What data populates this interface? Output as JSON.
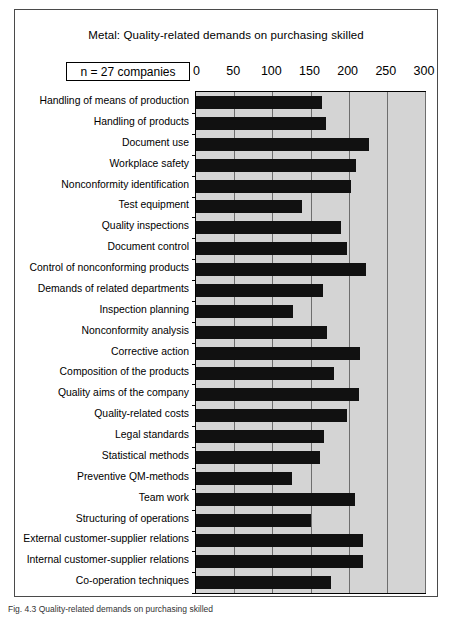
{
  "figure": {
    "caption": "Fig. 4.3  Quality-related demands on purchasing skilled"
  },
  "chart_data": {
    "type": "bar",
    "orientation": "horizontal",
    "title": "Metal: Quality-related demands on purchasing skilled",
    "annotation": "n = 27 companies",
    "xlabel": "",
    "ylabel": "",
    "xlim": [
      0,
      300
    ],
    "xticks": [
      0,
      50,
      100,
      150,
      200,
      250,
      300
    ],
    "xtick_labels": [
      "0",
      "50",
      "100",
      "150",
      "200",
      "250",
      "300"
    ],
    "grid": true,
    "legend": "none",
    "plot_background": "#d4d4d4",
    "bar_color": "#111111",
    "categories": [
      "Handling of means of production",
      "Handling of products",
      "Document use",
      "Workplace safety",
      "Nonconformity identification",
      "Test equipment",
      "Quality inspections",
      "Document control",
      "Control of nonconforming products",
      "Demands of related departments",
      "Inspection planning",
      "Nonconformity analysis",
      "Corrective action",
      "Composition of the  products",
      "Quality aims of the company",
      "Quality-related costs",
      "Legal standards",
      "Statistical methods",
      "Preventive QM-methods",
      "Team work",
      "Structuring of operations",
      "External customer-supplier relations",
      "Internal customer-supplier relations",
      "Co-operation techniques"
    ],
    "values": [
      165,
      170,
      227,
      209,
      203,
      139,
      190,
      198,
      223,
      167,
      127,
      172,
      215,
      181,
      214,
      198,
      168,
      163,
      126,
      208,
      150,
      219,
      219,
      177
    ]
  }
}
